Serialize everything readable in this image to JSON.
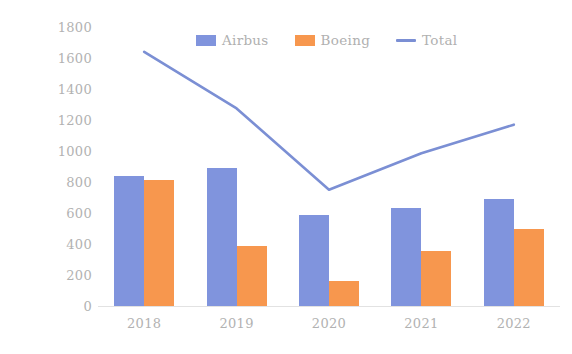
{
  "chart_data": {
    "type": "bar",
    "title": "",
    "subtitle": "",
    "xlabel": "",
    "ylabel": "Number of aircraft delivered",
    "categories": [
      "2018",
      "2019",
      "2020",
      "2021",
      "2022"
    ],
    "series": [
      {
        "name": "Airbus",
        "type": "bar",
        "color": "#8094dd",
        "values": [
          840,
          890,
          590,
          630,
          690
        ]
      },
      {
        "name": "Boeing",
        "type": "bar",
        "color": "#f7974e",
        "values": [
          810,
          390,
          160,
          355,
          500
        ]
      },
      {
        "name": "Total",
        "type": "line",
        "color": "#7b8fd4",
        "values": [
          1640,
          1275,
          750,
          985,
          1170
        ]
      }
    ],
    "ylim": [
      0,
      1800
    ],
    "ytick_labels": [
      "1800",
      "1600",
      "1400",
      "1200",
      "1000",
      "800",
      "600",
      "400",
      "200",
      "0"
    ],
    "ytick_values": [
      1800,
      1600,
      1400,
      1200,
      1000,
      800,
      600,
      400,
      200,
      0
    ],
    "grid": false,
    "legend_position": "top-center",
    "legend_entries": [
      {
        "label": "Airbus",
        "marker": "square",
        "color": "#8094dd"
      },
      {
        "label": "Boeing",
        "marker": "square",
        "color": "#f7974e"
      },
      {
        "label": "Total",
        "marker": "line",
        "color": "#7b8fd4"
      }
    ]
  },
  "axes": {
    "y_title": "Number of aircraft delivered"
  },
  "colors": {
    "airbus": "#8094dd",
    "boeing": "#f7974e",
    "total": "#7b8fd4",
    "tick_text": "#b2b2b2",
    "axis_line": "#e2e2e2",
    "background": "#ffffff"
  }
}
